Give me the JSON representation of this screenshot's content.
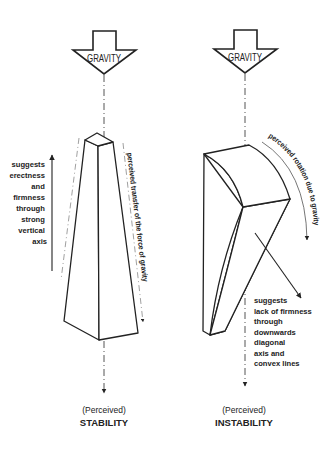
{
  "diagram": {
    "left": {
      "arrow_label": "GRAVITY",
      "side_note_lines": [
        "suggests",
        "erectness",
        "and",
        "firmness",
        "through",
        "strong",
        "vertical",
        "axis"
      ],
      "path_label": "perceived transfer of the force of gravity",
      "caption_sub": "(Perceived)",
      "caption_main": "STABILITY"
    },
    "right": {
      "arrow_label": "GRAVITY",
      "path_label": "perceived rotation due to gravity",
      "side_note_lines": [
        "suggests",
        "lack of firmness",
        "through",
        "downwards",
        "diagonal",
        "axis and",
        "convex lines"
      ],
      "caption_sub": "(Perceived)",
      "caption_main": "INSTABILITY"
    },
    "colors": {
      "line": "#222222",
      "dash_line": "#555555",
      "background": "#ffffff"
    }
  }
}
